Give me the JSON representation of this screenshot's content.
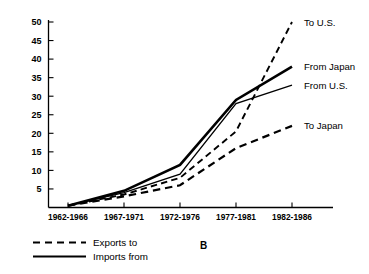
{
  "chart_data": {
    "type": "line",
    "title": "",
    "subtitle": "",
    "panel_label": "B",
    "xlabel": "",
    "ylabel": "",
    "categories": [
      "1962-1966",
      "1967-1971",
      "1972-1976",
      "1977-1981",
      "1982-1986"
    ],
    "ylim": [
      0,
      50
    ],
    "yticks": [
      5,
      10,
      15,
      20,
      25,
      30,
      35,
      40,
      45,
      50
    ],
    "ytick_labels": [
      "5",
      "10",
      "15",
      "20",
      "25",
      "30",
      "35",
      "40",
      "45",
      "50"
    ],
    "grid": false,
    "legend_position": "below-left",
    "series": [
      {
        "name": "To U.S.",
        "label": "To U.S.",
        "style": "dashed",
        "group": "Exports to",
        "values": [
          0.5,
          3.5,
          8.0,
          20.5,
          50.0
        ],
        "color": "#000000",
        "width": 1.9
      },
      {
        "name": "From Japan",
        "label": "From Japan",
        "style": "solid",
        "group": "Imports from",
        "values": [
          0.5,
          4.5,
          11.5,
          29.0,
          38.0
        ],
        "color": "#000000",
        "width": 2.6
      },
      {
        "name": "From U.S.",
        "label": "From U.S.",
        "style": "solid",
        "group": "Imports from",
        "values": [
          0.5,
          4.0,
          9.0,
          28.0,
          33.0
        ],
        "color": "#000000",
        "width": 1.3
      },
      {
        "name": "To Japan",
        "label": "To Japan",
        "style": "dashed",
        "group": "Exports to",
        "values": [
          0.5,
          3.0,
          6.0,
          16.0,
          22.0
        ],
        "color": "#000000",
        "width": 2.2
      }
    ],
    "legend": [
      {
        "label": "Exports to",
        "style": "dashed"
      },
      {
        "label": "Imports from",
        "style": "solid"
      }
    ]
  }
}
